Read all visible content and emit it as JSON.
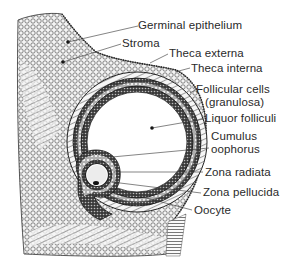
{
  "diagram": {
    "labels": [
      {
        "id": "germinal-epithelium",
        "text": "Germinal epithelium"
      },
      {
        "id": "stroma",
        "text": "Stroma"
      },
      {
        "id": "theca-externa",
        "text": "Theca externa"
      },
      {
        "id": "theca-interna",
        "text": "Theca interna"
      },
      {
        "id": "follicular-cells",
        "text": "Follicular cells"
      },
      {
        "id": "granulosa",
        "text": "(granulosa)"
      },
      {
        "id": "liquor-folliculi",
        "text": "Liquor folliculi"
      },
      {
        "id": "cumulus",
        "text": "Cumulus"
      },
      {
        "id": "oophorus",
        "text": "oophorus"
      },
      {
        "id": "zona-radiata",
        "text": "Zona radiata"
      },
      {
        "id": "zona-pellucida",
        "text": "Zona pellucida"
      },
      {
        "id": "oocyte",
        "text": "Oocyte"
      }
    ],
    "colors": {
      "ink": "#1e1e1e",
      "tissue_light": "#d9d9d9",
      "background": "#ffffff"
    }
  }
}
